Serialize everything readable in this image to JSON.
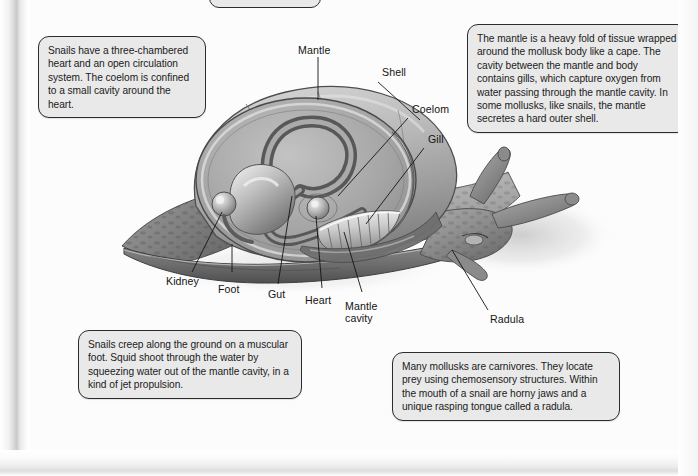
{
  "document": {
    "kind": "textbook-figure",
    "subject": "Mollusk (snail) internal anatomy cutaway"
  },
  "callouts": [
    {
      "id": "circulation",
      "text": "Snails have a three-chambered heart and an open circulation system. The coelom is confined to a small cavity around the heart."
    },
    {
      "id": "mantle",
      "text": "The mantle is a heavy fold of tissue wrapped around the mollusk body like a cape. The cavity between the mantle and body contains gills, which capture oxygen from water passing through the mantle cavity. In some mollusks, like snails, the mantle secretes a hard outer shell."
    },
    {
      "id": "foot",
      "text": "Snails creep along the ground on a muscular foot. Squid shoot through the water by squeezing water out of the mantle cavity, in a kind of jet propulsion."
    },
    {
      "id": "radula",
      "text": "Many mollusks are carnivores. They locate prey using chemosensory structures. Within the mouth of a snail are horny jaws and a unique rasping tongue called a radula."
    }
  ],
  "labels": {
    "mantle": "Mantle",
    "shell": "Shell",
    "coelom": "Coelom",
    "gill": "Gill",
    "kidney": "Kidney",
    "foot": "Foot",
    "gut": "Gut",
    "heart": "Heart",
    "mantle_cavity_line1": "Mantle",
    "mantle_cavity_line2": "cavity",
    "radula": "Radula"
  },
  "colors": {
    "callout_fill": "#e9e9e9",
    "callout_border": "#2c2c2c",
    "page_background": "#fcfcfc",
    "text": "#141414",
    "leader_line": "#1a1a1a",
    "shell_light": "#cfcfcf",
    "shell_mid": "#a8a8a8",
    "shell_dark": "#6e6e6e",
    "body_mid": "#9a9a9a",
    "body_dark": "#5a5a5a"
  }
}
